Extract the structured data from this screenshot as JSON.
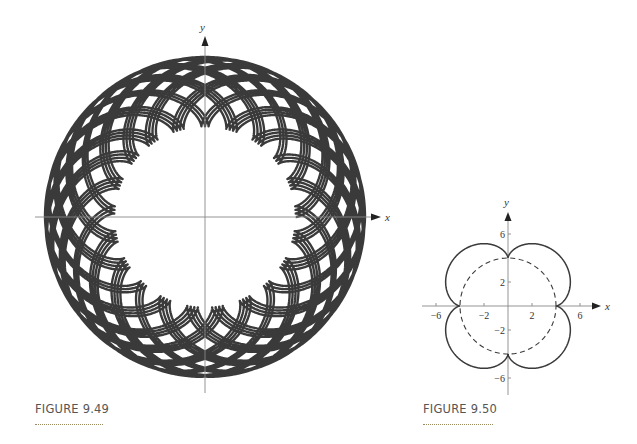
{
  "chart_data": [
    {
      "id": "figure-9-49",
      "type": "line",
      "caption": "FIGURE 9.49",
      "title": "Epicycloid (many loops)",
      "xlabel": "x",
      "ylabel": "y",
      "grid": false,
      "ticks": [],
      "curve": {
        "kind": "epicycloid",
        "a": 8,
        "b": 3.05,
        "t_max_turns": 30,
        "color": "#3a3a3a",
        "stroke_width": 2.4
      },
      "inner_radius_units": 8,
      "outer_radius_units": 14.1
    },
    {
      "id": "figure-9-50",
      "type": "line",
      "caption": "FIGURE 9.50",
      "xlabel": "x",
      "ylabel": "y",
      "grid": false,
      "xlim": [
        -7,
        7
      ],
      "ylim": [
        -7,
        7
      ],
      "x_ticks": [
        -6,
        -2,
        2,
        6
      ],
      "x_tick_labels": [
        "−6",
        "−2",
        "2",
        "6"
      ],
      "y_ticks": [
        6,
        2,
        -2,
        -6
      ],
      "y_tick_labels": [
        "6",
        "2",
        "−2",
        "−6"
      ],
      "series": [
        {
          "name": "epicycloid",
          "kind": "epicycloid",
          "a": 4,
          "b": 1,
          "style": "solid",
          "color": "#3a3a3a"
        },
        {
          "name": "fixed circle",
          "kind": "circle",
          "r": 4,
          "style": "dashed",
          "color": "#3a3a3a"
        }
      ]
    }
  ],
  "figures": {
    "left": {
      "caption": "FIGURE 9.49",
      "x_axis_label": "x",
      "y_axis_label": "y"
    },
    "right": {
      "caption": "FIGURE 9.50",
      "x_axis_label": "x",
      "y_axis_label": "y"
    }
  }
}
